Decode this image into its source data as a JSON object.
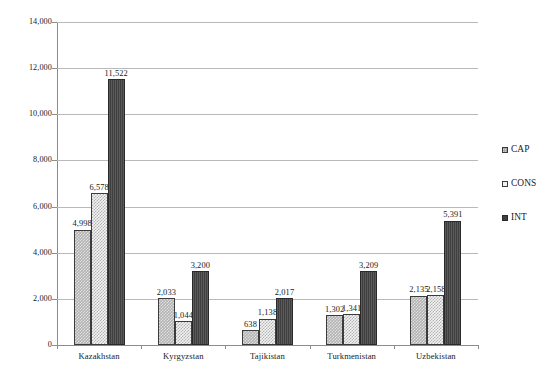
{
  "chart_data": {
    "type": "bar",
    "title": "",
    "subtitle": "",
    "xlabel": "",
    "ylabel": "",
    "categories": [
      "Kazakhstan",
      "Kyrgyzstan",
      "Tajikistan",
      "Turkmenistan",
      "Uzbekistan"
    ],
    "series": [
      {
        "name": "CAP",
        "values": [
          4998,
          2033,
          638,
          1302,
          2135
        ],
        "labels": [
          "4,998",
          "2,033",
          "638",
          "1,302",
          "2,135"
        ],
        "color": "#b3b3b3",
        "pattern": "checkered-gray"
      },
      {
        "name": "CONS",
        "values": [
          6578,
          1044,
          1138,
          1341,
          2158
        ],
        "labels": [
          "6,578",
          "1,044",
          "1,138",
          "1,341",
          "2,158"
        ],
        "color": "#f2f2f2",
        "pattern": "checkered-light"
      },
      {
        "name": "INT",
        "values": [
          11522,
          3200,
          2017,
          3209,
          5391
        ],
        "labels": [
          "11,522",
          "3,200",
          "2,017",
          "3,209",
          "5,391"
        ],
        "color": "#3f3f3f",
        "pattern": "solid-dark"
      }
    ],
    "bar_order_in_group": [
      "CAP",
      "CONS",
      "INT"
    ],
    "ylim": [
      0,
      14000
    ],
    "ytick_step": 2000,
    "ytick_values": [
      0,
      2000,
      4000,
      6000,
      8000,
      10000,
      12000,
      14000
    ],
    "ytick_labels": [
      "0",
      "2,000",
      "4,000",
      "6,000",
      "8,000",
      "10,000",
      "12,000",
      "14,000"
    ],
    "grid": "horizontal",
    "legend_position": "right",
    "data_labels": true
  },
  "legend": {
    "items": [
      {
        "label": "CAP",
        "swatch": "legend-swatch-cap"
      },
      {
        "label": "CONS",
        "swatch": "legend-swatch-cons"
      },
      {
        "label": "INT",
        "swatch": "legend-swatch-int"
      }
    ]
  },
  "axes": {
    "y": {
      "ticks": [
        {
          "value": 14000,
          "label": "14,000"
        },
        {
          "value": 12000,
          "label": "12,000"
        },
        {
          "value": 10000,
          "label": "10,000"
        },
        {
          "value": 8000,
          "label": "8,000"
        },
        {
          "value": 6000,
          "label": "6,000"
        },
        {
          "value": 4000,
          "label": "4,000"
        },
        {
          "value": 2000,
          "label": "2,000"
        },
        {
          "value": 0,
          "label": "0"
        }
      ]
    },
    "x": {
      "categories": [
        "Kazakhstan",
        "Kyrgyzstan",
        "Tajikistan",
        "Turkmenistan",
        "Uzbekistan"
      ]
    }
  },
  "colors": {
    "cap": "#b3b3b3",
    "cons": "#f2f2f2",
    "int": "#3f3f3f",
    "gridline": "#b9b9b9",
    "axis": "#8c8c8c",
    "text": "#1a1a1a",
    "background": "#ffffff"
  }
}
